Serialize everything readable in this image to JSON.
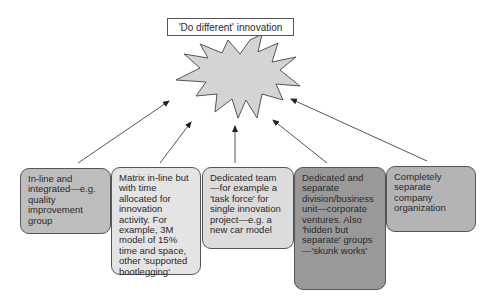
{
  "diagram": {
    "title": "'Do different' innovation",
    "center_shape": "explosion-star",
    "colors": {
      "star_fill": "#d4d4d4",
      "outline": "#555555",
      "box1": "#bdbdbd",
      "box2": "#e4e4e4",
      "box3": "#dcdcdc",
      "box4": "#999999",
      "box5": "#b4b4b4"
    },
    "boxes": [
      {
        "text": "In-line and integrated—e.g. quality improvement group"
      },
      {
        "text": "Matrix in-line but with time allocated for innovation activity.  For example, 3M model of 15% time and space, other 'supported bootlegging'"
      },
      {
        "text": "Dedicated team—for example a 'task force' for single innovation project—e.g. a new car model"
      },
      {
        "text": "Dedicated and separate division/business unit—corporate ventures.  Also 'hidden but separate' groups—'skunk works'"
      },
      {
        "text": "Completely separate company organization"
      }
    ]
  }
}
